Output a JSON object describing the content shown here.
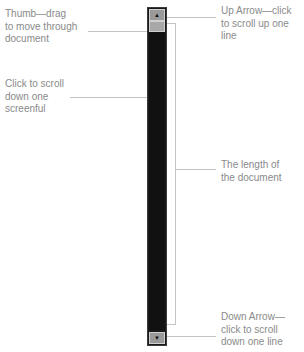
{
  "callouts": {
    "thumb": "Thumb—drag to move through document",
    "thumb_lines": [
      "Thumb—drag",
      "to move through",
      "document"
    ],
    "scroll_page_lines": [
      "Click to scroll",
      "down one",
      "screenful"
    ],
    "up_arrow_lines": [
      "Up Arrow—click",
      "to scroll up one",
      "line"
    ],
    "doc_length_lines": [
      "The length of",
      "the document"
    ],
    "down_arrow_lines": [
      "Down Arrow—",
      "click to scroll",
      "down one line"
    ]
  },
  "scrollbar": {
    "up_arrow_icon": "▲",
    "down_arrow_icon": "▼"
  },
  "colors": {
    "label_text": "#8a8a8a",
    "leader_line": "#c4c4c4",
    "track": "#111111",
    "thumb": "#a8a8a8"
  }
}
